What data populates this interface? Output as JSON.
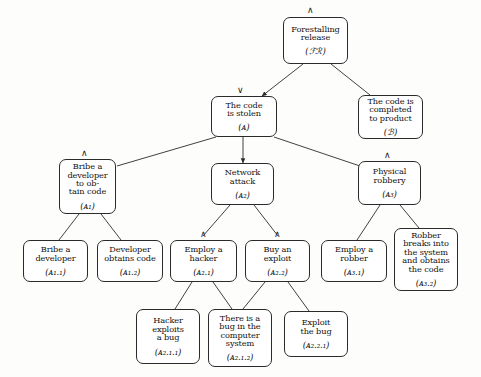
{
  "diagram": {
    "type": "attack-tree",
    "width": 481,
    "height": 377,
    "background_color": "#fdfdfc",
    "node_border_color": "#2b2b2b",
    "edge_color": "#2b2b2b",
    "text_color": "#111111",
    "gate_symbols": {
      "and": "∧",
      "or": "∨"
    }
  },
  "nodes": [
    {
      "key": "FR",
      "label": "Forestalling\nrelease",
      "id": "(ℱℛ)",
      "gate": "∧",
      "x": 283,
      "y": 17,
      "w": 65,
      "h": 47,
      "font_size": 8.2,
      "id_font_size": 8.6,
      "gate_x": 307,
      "gate_y": 6,
      "gate_size": 9
    },
    {
      "key": "A",
      "label": "The code\nis stolen",
      "id": "(ᴀ)",
      "gate": "∨",
      "x": 211,
      "y": 96,
      "w": 66,
      "h": 41,
      "font_size": 8.2,
      "id_font_size": 8.6,
      "gate_x": 237,
      "gate_y": 86,
      "gate_size": 9
    },
    {
      "key": "B",
      "label": "The code is\ncompleted\nto product",
      "id": "(ℬ)",
      "gate": "",
      "x": 358,
      "y": 95,
      "w": 65,
      "h": 44,
      "font_size": 8.2,
      "id_font_size": 8.6,
      "gate_x": 0,
      "gate_y": 0,
      "gate_size": 9
    },
    {
      "key": "A1",
      "label": "Bribe a\ndeveloper\nto ob-\ntain code",
      "id": "(ᴀ₁)",
      "gate": "∧",
      "x": 59,
      "y": 159,
      "w": 57,
      "h": 55,
      "font_size": 8.2,
      "id_font_size": 8.6,
      "gate_x": 81,
      "gate_y": 149,
      "gate_size": 9
    },
    {
      "key": "A2",
      "label": "Network\nattack",
      "id": "(ᴀ₂)",
      "gate": "",
      "x": 211,
      "y": 163,
      "w": 63,
      "h": 42,
      "font_size": 8.2,
      "id_font_size": 8.6,
      "gate_x": 0,
      "gate_y": 0,
      "gate_size": 9
    },
    {
      "key": "A3",
      "label": "Physical\nrobbery",
      "id": "(ᴀ₃)",
      "gate": "∧",
      "x": 358,
      "y": 161,
      "w": 63,
      "h": 44,
      "font_size": 8.2,
      "id_font_size": 8.6,
      "gate_x": 384,
      "gate_y": 151,
      "gate_size": 9
    },
    {
      "key": "A11",
      "label": "Bribe a\ndeveloper",
      "id": "(ᴀ₁.₁)",
      "gate": "",
      "x": 23,
      "y": 240,
      "w": 65,
      "h": 42,
      "font_size": 8.2,
      "id_font_size": 8.6,
      "gate_x": 0,
      "gate_y": 0,
      "gate_size": 9
    },
    {
      "key": "A12",
      "label": "Developer\nobtains code",
      "id": "(ᴀ₁.₂)",
      "gate": "",
      "x": 97,
      "y": 240,
      "w": 66,
      "h": 42,
      "font_size": 8.2,
      "id_font_size": 8.6,
      "gate_x": 0,
      "gate_y": 0,
      "gate_size": 9
    },
    {
      "key": "A21",
      "label": "Employ a\nhacker",
      "id": "(ᴀ₂.₁)",
      "gate": "∧",
      "x": 170,
      "y": 240,
      "w": 67,
      "h": 42,
      "font_size": 8.2,
      "id_font_size": 8.6,
      "gate_x": 200,
      "gate_y": 230,
      "gate_size": 9
    },
    {
      "key": "A22",
      "label": "Buy an\nexploit",
      "id": "(ᴀ₂.₂)",
      "gate": "∧",
      "x": 245,
      "y": 240,
      "w": 65,
      "h": 42,
      "font_size": 8.2,
      "id_font_size": 8.6,
      "gate_x": 274,
      "gate_y": 230,
      "gate_size": 9
    },
    {
      "key": "A31",
      "label": "Employ a\nrobber",
      "id": "(ᴀ₃.₁)",
      "gate": "",
      "x": 321,
      "y": 240,
      "w": 66,
      "h": 42,
      "font_size": 8.2,
      "id_font_size": 8.6,
      "gate_x": 0,
      "gate_y": 0,
      "gate_size": 9
    },
    {
      "key": "A32",
      "label": "Robber\nbreaks into\nthe system\nand obtains\nthe code",
      "id": "(ᴀ₃.₂)",
      "gate": "",
      "x": 394,
      "y": 228,
      "w": 64,
      "h": 63,
      "font_size": 8.2,
      "id_font_size": 8.6,
      "gate_x": 0,
      "gate_y": 0,
      "gate_size": 9
    },
    {
      "key": "A211",
      "label": "Hacker\nexploits\na bug",
      "id": "(ᴀ₂.₁.₁)",
      "gate": "",
      "x": 136,
      "y": 309,
      "w": 64,
      "h": 55,
      "font_size": 8.2,
      "id_font_size": 8.6,
      "gate_x": 0,
      "gate_y": 0,
      "gate_size": 9
    },
    {
      "key": "A212",
      "label": "There is a\nbug in the\ncomputer\nsystem",
      "id": "(ᴀ₂.₁.₂)",
      "gate": "",
      "x": 208,
      "y": 309,
      "w": 64,
      "h": 58,
      "font_size": 8.2,
      "id_font_size": 8.6,
      "gate_x": 0,
      "gate_y": 0,
      "gate_size": 9
    },
    {
      "key": "A221",
      "label": "Exploit\nthe bug",
      "id": "(ᴀ₂.₂.₁)",
      "gate": "",
      "x": 284,
      "y": 311,
      "w": 64,
      "h": 46,
      "font_size": 8.2,
      "id_font_size": 8.6,
      "gate_x": 0,
      "gate_y": 0,
      "gate_size": 9
    }
  ],
  "edges": [
    {
      "from": "FR",
      "to": "A",
      "x1": 303,
      "y1": 64,
      "x2": 262,
      "y2": 96,
      "arrow": true
    },
    {
      "from": "FR",
      "to": "B",
      "x1": 331,
      "y1": 64,
      "x2": 370,
      "y2": 95,
      "arrow": false
    },
    {
      "from": "A",
      "to": "A1",
      "x1": 216,
      "y1": 137,
      "x2": 117,
      "y2": 166,
      "arrow": false
    },
    {
      "from": "A",
      "to": "A2",
      "x1": 243,
      "y1": 137,
      "x2": 243,
      "y2": 163,
      "arrow": true
    },
    {
      "from": "A",
      "to": "A3",
      "x1": 274,
      "y1": 137,
      "x2": 360,
      "y2": 166,
      "arrow": false
    },
    {
      "from": "A1",
      "to": "A11",
      "x1": 79,
      "y1": 214,
      "x2": 59,
      "y2": 240,
      "arrow": false
    },
    {
      "from": "A1",
      "to": "A12",
      "x1": 101,
      "y1": 214,
      "x2": 121,
      "y2": 240,
      "arrow": false
    },
    {
      "from": "A2",
      "to": "A21",
      "x1": 230,
      "y1": 205,
      "x2": 203,
      "y2": 236,
      "arrow": false
    },
    {
      "from": "A2",
      "to": "A22",
      "x1": 254,
      "y1": 205,
      "x2": 278,
      "y2": 236,
      "arrow": false
    },
    {
      "from": "A3",
      "to": "A31",
      "x1": 380,
      "y1": 205,
      "x2": 357,
      "y2": 240,
      "arrow": false
    },
    {
      "from": "A3",
      "to": "A32",
      "x1": 400,
      "y1": 205,
      "x2": 419,
      "y2": 228,
      "arrow": false
    },
    {
      "from": "A21",
      "to": "A211",
      "x1": 192,
      "y1": 282,
      "x2": 175,
      "y2": 309,
      "arrow": false
    },
    {
      "from": "A21",
      "to": "A212",
      "x1": 213,
      "y1": 282,
      "x2": 232,
      "y2": 309,
      "arrow": false
    },
    {
      "from": "A22",
      "to": "A212",
      "x1": 265,
      "y1": 282,
      "x2": 243,
      "y2": 309,
      "arrow": false
    },
    {
      "from": "A22",
      "to": "A221",
      "x1": 288,
      "y1": 282,
      "x2": 309,
      "y2": 311,
      "arrow": false
    }
  ]
}
